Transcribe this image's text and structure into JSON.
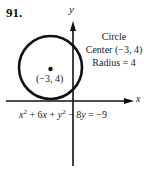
{
  "problem": {
    "number": "91."
  },
  "graph": {
    "x_axis_label": "x",
    "y_axis_label": "y",
    "center_point_label": "(−3, 4)",
    "circle": {
      "center": [
        -3,
        4
      ],
      "radius": 4
    }
  },
  "info": {
    "line1": "Circle",
    "line2": "Center (−3, 4)",
    "line3": "Radius = 4"
  },
  "equation": {
    "t1": "x",
    "e1": "2",
    "t2": " + 6",
    "t3": "x",
    "t4": " + ",
    "t5": "y",
    "e2": "2",
    "t6": " − 8",
    "t7": "y",
    "t8": " = −9"
  },
  "colors": {
    "ink": "#111111",
    "background": "#ffffff"
  }
}
